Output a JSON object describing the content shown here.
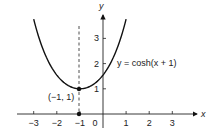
{
  "chart_data": {
    "type": "line",
    "title": "",
    "xlabel": "x",
    "ylabel": "y",
    "xlim": [
      -3.3,
      4
    ],
    "ylim": [
      -0.6,
      4
    ],
    "x_ticks": [
      "-3",
      "-2",
      "-1",
      "0",
      "1",
      "2",
      "3"
    ],
    "y_ticks": [
      "1",
      "2",
      "3"
    ],
    "grid": false,
    "series": [
      {
        "name": "y = cosh(x + 1)",
        "function": "cosh(x + 1)",
        "x": [
          -3,
          -2.5,
          -2,
          -1.5,
          -1,
          -0.5,
          0,
          0.5,
          1
        ],
        "values": [
          3.76,
          2.35,
          1.54,
          1.13,
          1.0,
          1.13,
          1.54,
          2.35,
          3.76
        ]
      }
    ],
    "annotations": [
      {
        "text": "(−1, 1)",
        "x": -1,
        "y": 1,
        "type": "point"
      },
      {
        "text": "",
        "x": -1,
        "y": 0,
        "type": "point"
      },
      {
        "text": "x = -1",
        "type": "dashed-vertical-line"
      }
    ],
    "curve_label": "y = cosh(x + 1)"
  },
  "labels": {
    "x_axis": "x",
    "y_axis": "y",
    "curve": "y = cosh(x + 1)",
    "vertex": "(−1, 1)",
    "origin": "0"
  }
}
